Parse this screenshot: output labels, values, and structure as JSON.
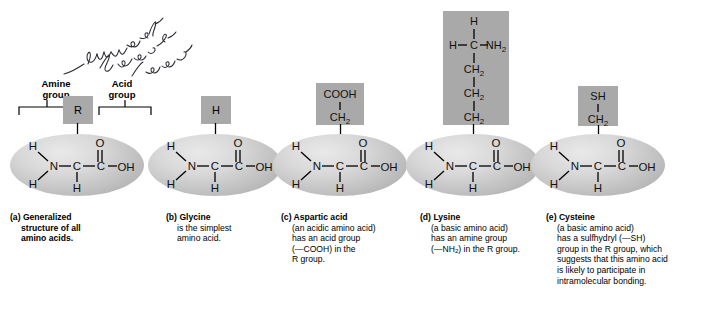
{
  "figure": {
    "handwritten_note": "Other molecules bonded to amino",
    "colors": {
      "r_group_box": "#a9a9a9",
      "ellipse_light": "#e9e9e9",
      "ellipse_dark": "#a5a5a5",
      "text": "#000000",
      "background": "#ffffff"
    }
  },
  "labels": {
    "amine_group": "Amine\ngroup",
    "acid_group": "Acid\ngroup"
  },
  "backbone": {
    "h_upper_left": "H",
    "h_lower_left": "H",
    "nitrogen": "N",
    "alpha_carbon": "C",
    "h_below_alpha": "H",
    "carboxyl_carbon": "C",
    "carbonyl_oxygen": "O",
    "hydroxyl": "OH"
  },
  "panels": [
    {
      "key": "generalized",
      "letter": "(a)",
      "name": "Generalized",
      "r_group": {
        "type": "single",
        "lines": [
          "R"
        ]
      },
      "caption_lines": [
        "structure of all",
        "amino acids."
      ],
      "caption_bold": true
    },
    {
      "key": "glycine",
      "letter": "(b)",
      "name": "Glycine",
      "r_group": {
        "type": "single",
        "lines": [
          "H"
        ]
      },
      "caption_lines": [
        "is the simplest",
        "amino acid."
      ],
      "caption_bold": false
    },
    {
      "key": "aspartic-acid",
      "letter": "(c)",
      "name": "Aspartic acid",
      "r_group": {
        "type": "stack",
        "lines": [
          "COOH",
          "CH2"
        ]
      },
      "caption_lines": [
        "(an acidic amino acid)",
        "has an acid group",
        "(—COOH) in the",
        "R group."
      ],
      "caption_bold": false
    },
    {
      "key": "lysine",
      "letter": "(d)",
      "name": "Lysine",
      "r_group": {
        "type": "chain",
        "lines": [
          "H",
          "H-C-NH2",
          "CH2",
          "CH2",
          "CH2"
        ]
      },
      "caption_lines": [
        "(a basic amino acid)",
        "has an amine group",
        "(—NH2) in the R group."
      ],
      "caption_bold": false
    },
    {
      "key": "cysteine",
      "letter": "(e)",
      "name": "Cysteine",
      "r_group": {
        "type": "stack",
        "lines": [
          "SH",
          "CH2"
        ]
      },
      "caption_lines": [
        "(a basic amino acid)",
        "has a sulfhydryl (—SH)",
        "group in the R group, which",
        "suggests that this amino acid",
        "is likely to participate in",
        "intramolecular bonding."
      ],
      "caption_bold": false
    }
  ]
}
